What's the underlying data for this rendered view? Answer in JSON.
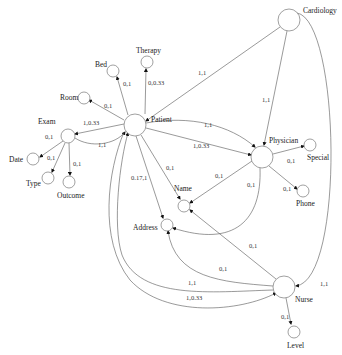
{
  "diagram": {
    "type": "entity-relationship-graph",
    "nodes": [
      {
        "id": "cardiology",
        "label": "Cardiology"
      },
      {
        "id": "patient",
        "label": "Patient"
      },
      {
        "id": "physician",
        "label": "Physician"
      },
      {
        "id": "special",
        "label": "Special"
      },
      {
        "id": "phone",
        "label": "Phone"
      },
      {
        "id": "exam",
        "label": "Exam"
      },
      {
        "id": "date",
        "label": "Date"
      },
      {
        "id": "type",
        "label": "Type"
      },
      {
        "id": "outcome",
        "label": "Outcome"
      },
      {
        "id": "room",
        "label": "Room"
      },
      {
        "id": "bed",
        "label": "Bed"
      },
      {
        "id": "therapy",
        "label": "Therapy"
      },
      {
        "id": "name",
        "label": "Name"
      },
      {
        "id": "address",
        "label": "Address"
      },
      {
        "id": "nurse",
        "label": "Nurse"
      },
      {
        "id": "level",
        "label": "Level"
      }
    ],
    "edges": [
      {
        "from": "cardiology",
        "to": "patient",
        "label": "1,1"
      },
      {
        "from": "cardiology",
        "to": "physician",
        "label": "1,1"
      },
      {
        "from": "cardiology",
        "to": "nurse",
        "label": "1,1"
      },
      {
        "from": "patient",
        "to": "therapy",
        "label": "0,0.33"
      },
      {
        "from": "patient",
        "to": "bed",
        "label": "0,1"
      },
      {
        "from": "patient",
        "to": "room",
        "label": "0,1"
      },
      {
        "from": "patient",
        "to": "exam",
        "label": "1,0.33"
      },
      {
        "from": "exam",
        "to": "patient",
        "label": "1,1"
      },
      {
        "from": "exam",
        "to": "date",
        "label": "0,1"
      },
      {
        "from": "exam",
        "to": "type",
        "label": "0,1"
      },
      {
        "from": "exam",
        "to": "outcome",
        "label": "0,1"
      },
      {
        "from": "patient",
        "to": "physician",
        "label": "1,1"
      },
      {
        "from": "patient",
        "to": "physician",
        "label": "1,0.33"
      },
      {
        "from": "patient",
        "to": "name",
        "label": "0,1"
      },
      {
        "from": "patient",
        "to": "address",
        "label": "0.17,1"
      },
      {
        "from": "physician",
        "to": "special",
        "label": "0,1"
      },
      {
        "from": "physician",
        "to": "phone",
        "label": "0,1"
      },
      {
        "from": "physician",
        "to": "name",
        "label": "0,1"
      },
      {
        "from": "physician",
        "to": "address",
        "label": "0,1"
      },
      {
        "from": "nurse",
        "to": "name",
        "label": "0,1"
      },
      {
        "from": "nurse",
        "to": "address",
        "label": "0,1"
      },
      {
        "from": "nurse",
        "to": "patient",
        "label": "1,1"
      },
      {
        "from": "patient",
        "to": "nurse",
        "label": "1,0.33"
      },
      {
        "from": "nurse",
        "to": "level",
        "label": "0,1"
      }
    ]
  }
}
